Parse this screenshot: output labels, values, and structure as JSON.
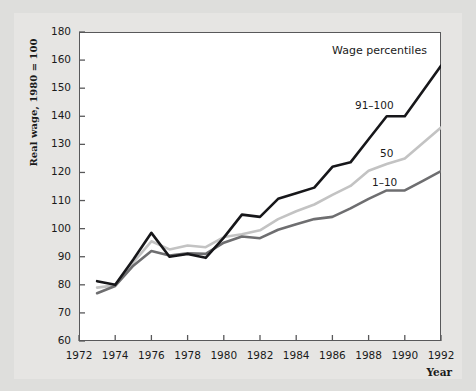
{
  "chart_data": {
    "type": "line",
    "title": "",
    "xlabel": "Year",
    "ylabel": "Real wage, 1980 = 100",
    "legend_title": "Wage percentiles",
    "legend_position": "inline-right",
    "grid": false,
    "xlim": [
      1972,
      1992
    ],
    "ylim": [
      60,
      180
    ],
    "x_tick_labels": [
      "1972",
      "1974",
      "1976",
      "1978",
      "1980",
      "1982",
      "1984",
      "1986",
      "1988",
      "1990",
      "1992"
    ],
    "x_tick_values": [
      1972,
      1974,
      1976,
      1978,
      1980,
      1982,
      1984,
      1986,
      1988,
      1990,
      1992
    ],
    "y_tick_labels": [
      "60",
      "70",
      "80",
      "90",
      "100",
      "110",
      "120",
      "130",
      "140",
      "150",
      "160",
      "180"
    ],
    "y_tick_values": [
      60,
      70,
      80,
      90,
      100,
      110,
      120,
      130,
      140,
      150,
      160,
      170
    ],
    "y_axis_top_label": "180",
    "x": [
      1973,
      1974,
      1975,
      1976,
      1977,
      1978,
      1979,
      1980,
      1981,
      1982,
      1983,
      1984,
      1985,
      1986,
      1987,
      1988,
      1989,
      1990,
      1991,
      1992
    ],
    "series": [
      {
        "name": "91–100",
        "color": "#17171a",
        "width": 2.6,
        "values": [
          81.3,
          80.0,
          89.0,
          98.5,
          90.0,
          91.0,
          89.6,
          96.8,
          105.0,
          104.2,
          110.6,
          112.6,
          114.6,
          122.0,
          123.6,
          131.8,
          140.0,
          140.0,
          149.0,
          158.0
        ]
      },
      {
        "name": "50",
        "color": "#c3c3c3",
        "width": 2.6,
        "values": [
          79.0,
          79.8,
          88.0,
          95.5,
          92.6,
          94.0,
          93.4,
          97.0,
          98.0,
          99.4,
          103.4,
          106.2,
          108.6,
          112.0,
          115.2,
          120.6,
          123.0,
          125.0,
          130.5,
          136.0
        ]
      },
      {
        "name": "1–10",
        "color": "#6e6e70",
        "width": 2.6,
        "values": [
          77.0,
          79.6,
          86.8,
          92.0,
          90.4,
          91.2,
          91.0,
          95.0,
          97.2,
          96.6,
          99.6,
          101.6,
          103.4,
          104.2,
          107.2,
          110.6,
          113.6,
          113.6,
          117.0,
          120.5
        ]
      }
    ],
    "series_label_positions": [
      {
        "name": "91–100",
        "anchor_year": 1988.2,
        "anchor_value": 145.0
      },
      {
        "name": "50",
        "anchor_year": 1990.0,
        "anchor_value": 131.0
      },
      {
        "name": "1–10",
        "anchor_year": 1989.4,
        "anchor_value": 118.0
      }
    ]
  }
}
